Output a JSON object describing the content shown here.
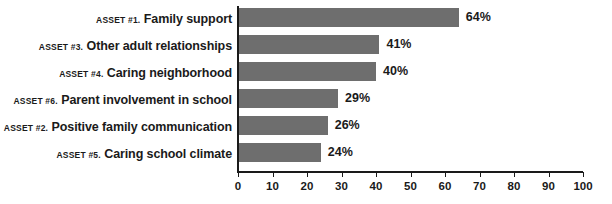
{
  "chart_data": {
    "type": "bar",
    "orientation": "horizontal",
    "title": "",
    "xlabel": "",
    "ylabel": "",
    "xlim": [
      0,
      100
    ],
    "xticks": [
      0,
      10,
      20,
      30,
      40,
      50,
      60,
      70,
      80,
      90,
      100
    ],
    "grid": false,
    "legend": false,
    "value_suffix": "%",
    "bar_color": "#6e6e6e",
    "axis_color": "#1a1a1a",
    "background_color": "#ffffff",
    "categories": [
      "ASSET #1. Family support",
      "ASSET #3. Other adult relationships",
      "ASSET #4. Caring neighborhood",
      "ASSET #6. Parent involvement in school",
      "ASSET #2. Positive family communication",
      "ASSET #5. Caring school climate"
    ],
    "values": [
      64,
      41,
      40,
      29,
      26,
      24
    ],
    "bars": [
      {
        "asset_tag": "ASSET #1.",
        "asset_name": "Family support",
        "value": 64,
        "value_label": "64%"
      },
      {
        "asset_tag": "ASSET #3.",
        "asset_name": "Other adult relationships",
        "value": 41,
        "value_label": "41%"
      },
      {
        "asset_tag": "ASSET #4.",
        "asset_name": "Caring neighborhood",
        "value": 40,
        "value_label": "40%"
      },
      {
        "asset_tag": "ASSET #6.",
        "asset_name": "Parent involvement in school",
        "value": 29,
        "value_label": "29%"
      },
      {
        "asset_tag": "ASSET #2.",
        "asset_name": "Positive family communication",
        "value": 26,
        "value_label": "26%"
      },
      {
        "asset_tag": "ASSET #5.",
        "asset_name": "Caring school climate",
        "value": 24,
        "value_label": "24%"
      }
    ],
    "tick_labels": [
      "0",
      "10",
      "20",
      "30",
      "40",
      "50",
      "60",
      "70",
      "80",
      "90",
      "100"
    ]
  }
}
